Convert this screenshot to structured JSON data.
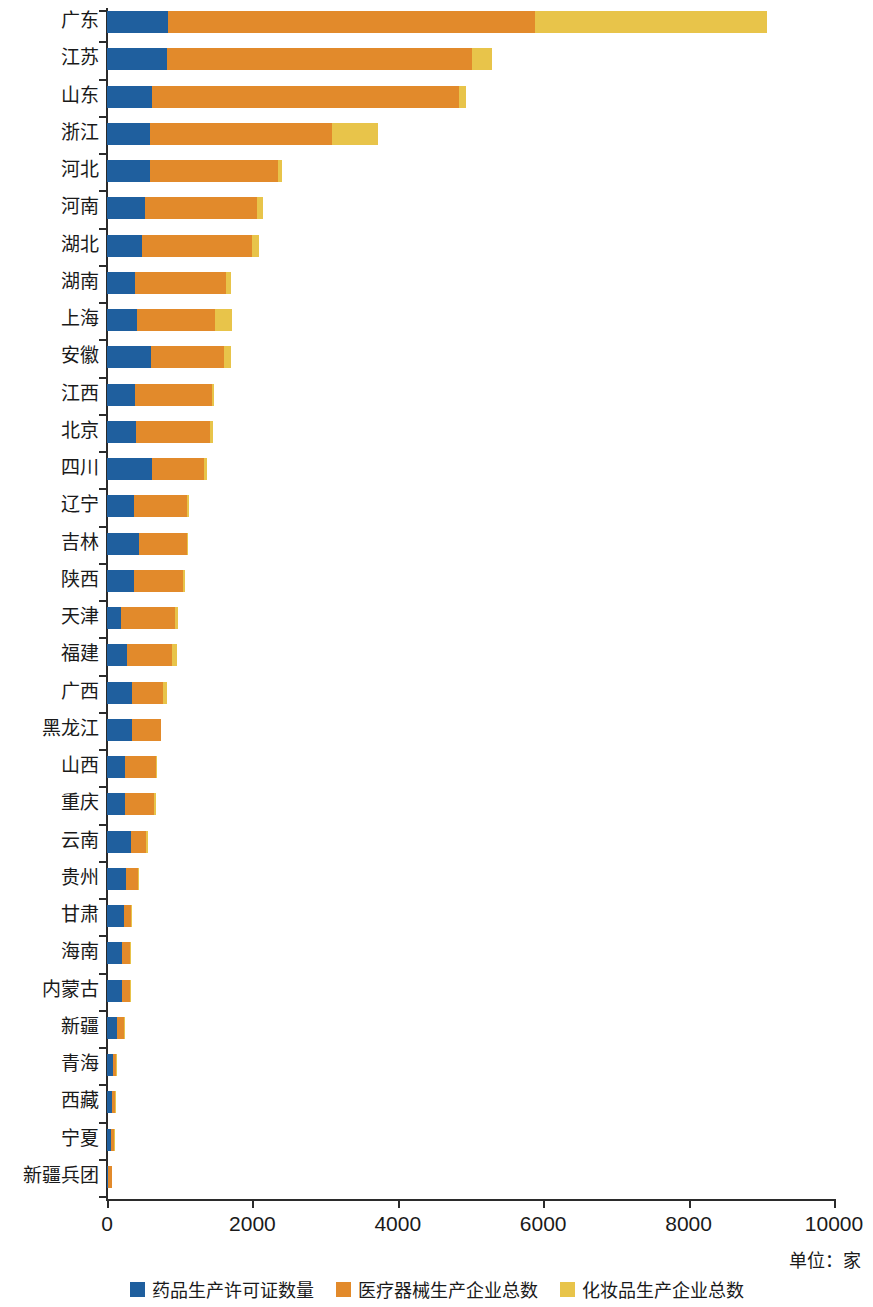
{
  "chart_data": {
    "type": "bar",
    "orientation": "horizontal",
    "stacked": true,
    "title": "",
    "subtitle": "",
    "xlabel": "",
    "ylabel": "",
    "unit_note": "单位：家",
    "xlim": [
      0,
      10000
    ],
    "xticks": [
      0,
      2000,
      4000,
      6000,
      8000,
      10000
    ],
    "xtick_labels": [
      "0",
      "2000",
      "4000",
      "6000",
      "8000",
      "10000"
    ],
    "grid": false,
    "legend_position": "bottom",
    "categories": [
      "广东",
      "江苏",
      "山东",
      "浙江",
      "河北",
      "河南",
      "湖北",
      "湖南",
      "上海",
      "安徽",
      "江西",
      "北京",
      "四川",
      "辽宁",
      "吉林",
      "陕西",
      "天津",
      "福建",
      "广西",
      "黑龙江",
      "山西",
      "重庆",
      "云南",
      "贵州",
      "甘肃",
      "海南",
      "内蒙古",
      "新疆",
      "青海",
      "西藏",
      "宁夏",
      "新疆兵团"
    ],
    "series": [
      {
        "name": "药品生产许可证数量",
        "color": "#1f5f9e",
        "values": [
          840,
          825,
          620,
          590,
          590,
          520,
          480,
          385,
          410,
          605,
          385,
          400,
          620,
          370,
          440,
          370,
          190,
          275,
          345,
          345,
          250,
          250,
          330,
          260,
          230,
          205,
          205,
          140,
          80,
          70,
          55,
          10
        ]
      },
      {
        "name": "医疗器械生产企业总数",
        "color": "#e28a2b",
        "values": [
          5045,
          4195,
          4220,
          2505,
          1760,
          1550,
          1520,
          1250,
          1075,
          1010,
          1055,
          1015,
          710,
          730,
          660,
          680,
          740,
          620,
          420,
          400,
          420,
          400,
          210,
          165,
          95,
          105,
          105,
          90,
          40,
          40,
          45,
          60
        ]
      },
      {
        "name": "化妆品生产企业总数",
        "color": "#e8c44a",
        "values": [
          3190,
          275,
          100,
          630,
          55,
          75,
          90,
          70,
          235,
          90,
          30,
          45,
          45,
          30,
          15,
          20,
          50,
          65,
          60,
          0,
          20,
          25,
          25,
          15,
          5,
          5,
          5,
          5,
          5,
          5,
          5,
          0
        ]
      }
    ],
    "totals": [
      9075,
      5295,
      4940,
      3725,
      2405,
      2145,
      2090,
      1705,
      1720,
      1705,
      1470,
      1460,
      1375,
      1130,
      1115,
      1070,
      980,
      960,
      825,
      745,
      690,
      675,
      565,
      440,
      330,
      315,
      315,
      235,
      125,
      115,
      105,
      70
    ]
  },
  "legend": {
    "items": [
      {
        "label": "药品生产许可证数量",
        "color": "#1f5f9e"
      },
      {
        "label": "医疗器械生产企业总数",
        "color": "#e28a2b"
      },
      {
        "label": "化妆品生产企业总数",
        "color": "#e8c44a"
      }
    ]
  }
}
